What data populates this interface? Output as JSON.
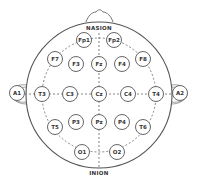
{
  "diagram": {
    "landmarks": {
      "nasion": "NASION",
      "inion": "INION"
    },
    "colors": {
      "stroke": "#555555",
      "text": "#333333",
      "background": "#ffffff"
    },
    "electrodes": [
      {
        "id": "Fp1",
        "label": "Fp1",
        "x": 84,
        "y": 40
      },
      {
        "id": "Fp2",
        "label": "Fp2",
        "x": 114,
        "y": 40
      },
      {
        "id": "F7",
        "label": "F7",
        "x": 55,
        "y": 59
      },
      {
        "id": "F3",
        "label": "F3",
        "x": 76,
        "y": 64
      },
      {
        "id": "Fz",
        "label": "Fz",
        "x": 99,
        "y": 64
      },
      {
        "id": "F4",
        "label": "F4",
        "x": 122,
        "y": 64
      },
      {
        "id": "F8",
        "label": "F8",
        "x": 143,
        "y": 59
      },
      {
        "id": "A1",
        "label": "A1",
        "x": 17,
        "y": 93
      },
      {
        "id": "T3",
        "label": "T3",
        "x": 42,
        "y": 94
      },
      {
        "id": "C3",
        "label": "C3",
        "x": 70,
        "y": 94
      },
      {
        "id": "Cz",
        "label": "Cz",
        "x": 99,
        "y": 94
      },
      {
        "id": "C4",
        "label": "C4",
        "x": 128,
        "y": 94
      },
      {
        "id": "T4",
        "label": "T4",
        "x": 156,
        "y": 94
      },
      {
        "id": "A2",
        "label": "A2",
        "x": 180,
        "y": 93
      },
      {
        "id": "T5",
        "label": "T5",
        "x": 55,
        "y": 127
      },
      {
        "id": "P3",
        "label": "P3",
        "x": 76,
        "y": 122
      },
      {
        "id": "Pz",
        "label": "Pz",
        "x": 99,
        "y": 122
      },
      {
        "id": "P4",
        "label": "P4",
        "x": 122,
        "y": 122
      },
      {
        "id": "T6",
        "label": "T6",
        "x": 143,
        "y": 127
      },
      {
        "id": "O1",
        "label": "O1",
        "x": 82,
        "y": 152
      },
      {
        "id": "O2",
        "label": "O2",
        "x": 117,
        "y": 152
      }
    ]
  }
}
